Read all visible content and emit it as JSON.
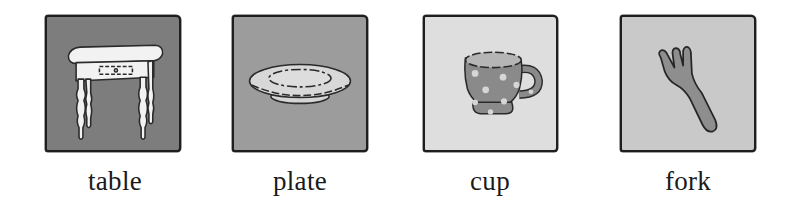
{
  "cards": [
    {
      "id": "table",
      "label": "table",
      "icon": "table-icon",
      "bg_color": "#7d7d7d"
    },
    {
      "id": "plate",
      "label": "plate",
      "icon": "plate-icon",
      "bg_color": "#9c9c9c"
    },
    {
      "id": "cup",
      "label": "cup",
      "icon": "cup-icon",
      "bg_color": "#dedede"
    },
    {
      "id": "fork",
      "label": "fork",
      "icon": "fork-icon",
      "bg_color": "#c9c9c9"
    }
  ]
}
